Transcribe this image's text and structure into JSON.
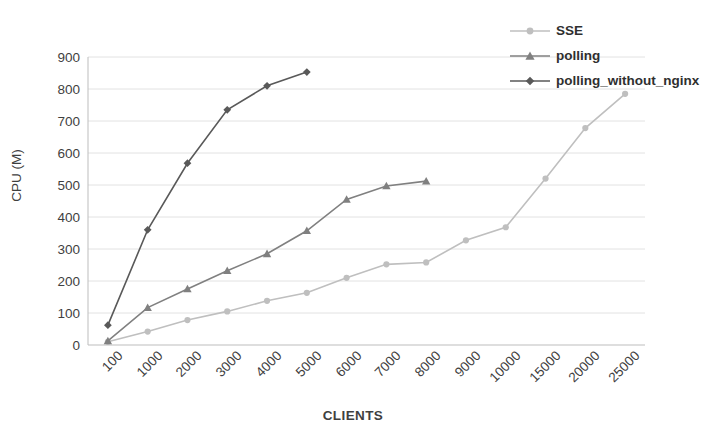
{
  "chart_data": {
    "type": "line",
    "title": "",
    "xlabel": "CLIENTS",
    "ylabel": "CPU (M)",
    "ylim": [
      0,
      900
    ],
    "ytick_step": 100,
    "yticks": [
      900,
      800,
      700,
      600,
      500,
      400,
      300,
      200,
      100,
      0
    ],
    "grid": true,
    "grid_axis": "y",
    "legend_position": "top-right",
    "categories": [
      "100",
      "1000",
      "2000",
      "3000",
      "4000",
      "5000",
      "6000",
      "7000",
      "8000",
      "9000",
      "10000",
      "15000",
      "20000",
      "25000"
    ],
    "series": [
      {
        "name": "SSE",
        "color": "#bfbfbf",
        "marker": "circle",
        "values": [
          10,
          42,
          78,
          105,
          138,
          163,
          210,
          252,
          258,
          327,
          368,
          520,
          678,
          785
        ]
      },
      {
        "name": "polling",
        "color": "#808080",
        "marker": "triangle",
        "values": [
          13,
          117,
          175,
          232,
          285,
          357,
          455,
          497,
          512,
          null,
          null,
          null,
          null,
          null
        ]
      },
      {
        "name": "polling_without_nginx",
        "color": "#595959",
        "marker": "diamond",
        "values": [
          62,
          360,
          568,
          735,
          810,
          853,
          null,
          null,
          null,
          null,
          null,
          null,
          null,
          null
        ]
      }
    ]
  },
  "legend": {
    "items": [
      {
        "label": "SSE",
        "color": "#bfbfbf",
        "marker": "circle"
      },
      {
        "label": "polling",
        "color": "#808080",
        "marker": "triangle"
      },
      {
        "label": "polling_without_nginx",
        "color": "#595959",
        "marker": "diamond"
      }
    ]
  },
  "axes": {
    "x_title": "CLIENTS",
    "y_title": "CPU (M)"
  }
}
